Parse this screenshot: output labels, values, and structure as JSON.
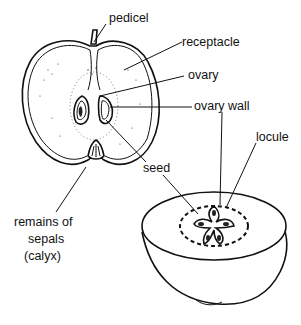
{
  "figure": {
    "views": [
      "longitudinal-section",
      "transverse-section-half"
    ]
  },
  "labels": {
    "pedicel": "pedicel",
    "receptacle": "receptacle",
    "ovary": "ovary",
    "ovary_wall": "ovary wall",
    "locule": "locule",
    "seed": "seed",
    "sepals_line1": "remains of",
    "sepals_line2": "sepals",
    "sepals_line3": "(calyx)"
  },
  "colors": {
    "ink": "#111111",
    "background": "#ffffff"
  }
}
